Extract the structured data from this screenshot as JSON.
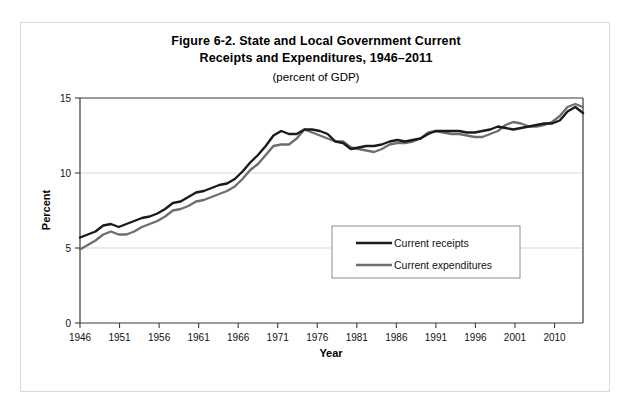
{
  "figure": {
    "title_line1": "Figure 6-2. State and Local Government Current",
    "title_line2": "Receipts and Expenditures, 1946–2011",
    "subtitle": "(percent of GDP)"
  },
  "colors": {
    "receipts": "#1a1a1a",
    "expenditures": "#6e6e6e",
    "grid": "#d2d2d2",
    "axis": "#3a3a3a",
    "frame": "#d9d9d9"
  },
  "chart_data": {
    "type": "line",
    "title": "Figure 6-2. State and Local Government Current Receipts and Expenditures, 1946–2011",
    "subtitle": "(percent of GDP)",
    "xlabel": "Year",
    "ylabel": "Percent",
    "xlim": [
      1946,
      2011
    ],
    "ylim": [
      0,
      15
    ],
    "yticks": [
      0,
      5,
      10,
      15
    ],
    "ytick_labels": [
      "0",
      "5",
      "10",
      "15"
    ],
    "xticks": [
      1946,
      1951,
      1956,
      1961,
      1966,
      1971,
      1976,
      1981,
      1986,
      1991,
      1996,
      2001,
      2010
    ],
    "xtick_labels": [
      "1946",
      "1951",
      "1956",
      "1961",
      "1966",
      "1971",
      "1976",
      "1981",
      "1986",
      "1991",
      "1996",
      "2001",
      "2010"
    ],
    "grid": "horizontal",
    "legend_position": "center-right-inside",
    "x": [
      1946,
      1947,
      1948,
      1949,
      1950,
      1951,
      1952,
      1953,
      1954,
      1955,
      1956,
      1957,
      1958,
      1959,
      1960,
      1961,
      1962,
      1963,
      1964,
      1965,
      1966,
      1967,
      1968,
      1969,
      1970,
      1971,
      1972,
      1973,
      1974,
      1975,
      1976,
      1977,
      1978,
      1979,
      1980,
      1981,
      1982,
      1983,
      1984,
      1985,
      1986,
      1987,
      1988,
      1989,
      1990,
      1991,
      1992,
      1993,
      1994,
      1995,
      1996,
      1997,
      1998,
      1999,
      2000,
      2001,
      2002,
      2003,
      2004,
      2005,
      2006,
      2007,
      2008,
      2009,
      2010,
      2011
    ],
    "series": [
      {
        "name": "Current receipts",
        "color": "#1a1a1a",
        "values": [
          5.7,
          5.9,
          6.1,
          6.5,
          6.6,
          6.4,
          6.6,
          6.8,
          7.0,
          7.1,
          7.3,
          7.6,
          8.0,
          8.1,
          8.4,
          8.7,
          8.8,
          9.0,
          9.2,
          9.3,
          9.6,
          10.1,
          10.7,
          11.2,
          11.8,
          12.5,
          12.8,
          12.6,
          12.6,
          12.9,
          12.9,
          12.8,
          12.6,
          12.1,
          12.0,
          11.6,
          11.7,
          11.8,
          11.8,
          11.9,
          12.1,
          12.2,
          12.1,
          12.2,
          12.3,
          12.6,
          12.8,
          12.8,
          12.8,
          12.8,
          12.7,
          12.7,
          12.8,
          12.9,
          13.1,
          13.0,
          12.9,
          13.0,
          13.1,
          13.2,
          13.3,
          13.3,
          13.5,
          14.1,
          14.4,
          14.0
        ]
      },
      {
        "name": "Current expenditures",
        "color": "#6e6e6e",
        "values": [
          4.9,
          5.2,
          5.5,
          5.9,
          6.1,
          5.9,
          5.9,
          6.1,
          6.4,
          6.6,
          6.8,
          7.1,
          7.5,
          7.6,
          7.8,
          8.1,
          8.2,
          8.4,
          8.6,
          8.8,
          9.1,
          9.6,
          10.2,
          10.6,
          11.2,
          11.8,
          11.9,
          11.9,
          12.3,
          12.9,
          12.7,
          12.5,
          12.3,
          12.1,
          12.1,
          11.7,
          11.6,
          11.5,
          11.4,
          11.6,
          11.9,
          12.0,
          12.0,
          12.1,
          12.3,
          12.7,
          12.8,
          12.7,
          12.6,
          12.6,
          12.5,
          12.4,
          12.4,
          12.6,
          12.8,
          13.2,
          13.4,
          13.3,
          13.1,
          13.1,
          13.2,
          13.4,
          13.8,
          14.4,
          14.6,
          14.4
        ]
      }
    ]
  },
  "legend": {
    "items": [
      {
        "label": "Current receipts",
        "color": "#1a1a1a"
      },
      {
        "label": "Current expenditures",
        "color": "#6e6e6e"
      }
    ]
  }
}
